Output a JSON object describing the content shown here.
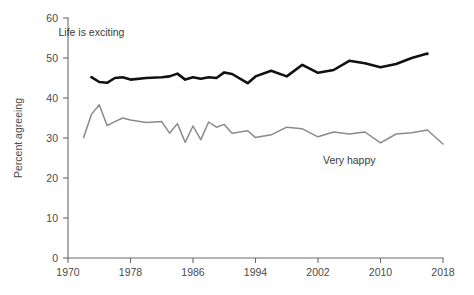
{
  "chart_data": {
    "type": "line",
    "title": "",
    "xlabel": "",
    "ylabel": "Percent agreeing",
    "xlim": [
      1970,
      2018
    ],
    "ylim": [
      0,
      60
    ],
    "ytick_values": [
      0,
      10,
      20,
      30,
      40,
      50,
      60
    ],
    "ytick_labels": [
      "0",
      "10",
      "20",
      "30",
      "40",
      "50",
      "60"
    ],
    "xtick_values": [
      1970,
      1978,
      1986,
      1994,
      2002,
      2010,
      2018
    ],
    "xtick_labels": [
      "1970",
      "1978",
      "1986",
      "1994",
      "2002",
      "2010",
      "2018"
    ],
    "grid": false,
    "legend_position": "inline-annotations",
    "series": [
      {
        "name": "Life is exciting",
        "color": "#111111",
        "stroke_width": 2.6,
        "label_x": 1973,
        "label_y": 55.5,
        "x": [
          1973,
          1974,
          1975,
          1976,
          1977,
          1978,
          1980,
          1982,
          1983,
          1984,
          1985,
          1986,
          1987,
          1988,
          1989,
          1990,
          1991,
          1993,
          1994,
          1996,
          1998,
          2000,
          2002,
          2004,
          2006,
          2008,
          2010,
          2012,
          2014,
          2016
        ],
        "y": [
          45.2,
          44.0,
          43.8,
          45.0,
          45.2,
          44.6,
          45.0,
          45.2,
          45.4,
          46.1,
          44.6,
          45.2,
          44.8,
          45.2,
          45.0,
          46.4,
          46.0,
          43.7,
          45.4,
          46.8,
          45.4,
          48.3,
          46.3,
          47.0,
          49.3,
          48.7,
          47.7,
          48.5,
          50.0,
          51.1
        ],
        "y_last": 51.0
      },
      {
        "name": "Very happy",
        "color": "#8a8a8a",
        "stroke_width": 1.5,
        "label_x": 2006,
        "label_y": 23.5,
        "x": [
          1972,
          1973,
          1974,
          1975,
          1976,
          1977,
          1978,
          1980,
          1982,
          1983,
          1984,
          1985,
          1986,
          1987,
          1988,
          1989,
          1990,
          1991,
          1993,
          1994,
          1996,
          1998,
          2000,
          2002,
          2004,
          2006,
          2008,
          2010,
          2012,
          2014,
          2016,
          2018
        ],
        "y": [
          30.1,
          35.9,
          38.3,
          33.1,
          34.1,
          35.0,
          34.5,
          33.9,
          34.1,
          31.2,
          33.6,
          28.9,
          33.0,
          29.6,
          34.0,
          32.7,
          33.4,
          31.2,
          31.8,
          30.1,
          30.8,
          32.7,
          32.3,
          30.3,
          31.5,
          31.0,
          31.5,
          28.8,
          31.0,
          31.3,
          32.0,
          28.5
        ]
      }
    ]
  },
  "labels": {
    "series_exciting": "Life is exciting",
    "series_happy": "Very happy",
    "y_axis_title": "Percent agreeing"
  }
}
